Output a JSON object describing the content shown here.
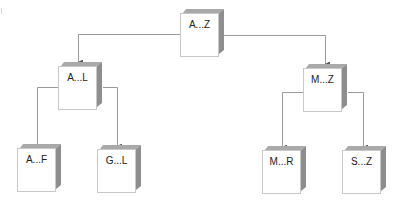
{
  "diagram": {
    "type": "tree",
    "root": "A...Z",
    "nodes": [
      {
        "id": "az",
        "label": "A...Z",
        "level": 0
      },
      {
        "id": "al",
        "label": "A...L",
        "level": 1,
        "parent": "az"
      },
      {
        "id": "mz",
        "label": "M...Z",
        "level": 1,
        "parent": "az"
      },
      {
        "id": "af",
        "label": "A...F",
        "level": 2,
        "parent": "al"
      },
      {
        "id": "gl",
        "label": "G...L",
        "level": 2,
        "parent": "al"
      },
      {
        "id": "mr",
        "label": "M...R",
        "level": 2,
        "parent": "mz"
      },
      {
        "id": "sz",
        "label": "S...Z",
        "level": 2,
        "parent": "mz"
      }
    ],
    "edges": [
      {
        "from": "A...Z",
        "to": "A...L"
      },
      {
        "from": "A...Z",
        "to": "M...Z"
      },
      {
        "from": "A...L",
        "to": "A...F"
      },
      {
        "from": "A...L",
        "to": "G...L"
      },
      {
        "from": "M...Z",
        "to": "M...R"
      },
      {
        "from": "M...Z",
        "to": "S...Z"
      }
    ],
    "colors": {
      "line": "#9a9a9a",
      "box_shade_top": "#a9a9a9",
      "box_shade_side": "#8e8e8e",
      "box_border": "#c8c8c8",
      "text": "#222222"
    }
  }
}
